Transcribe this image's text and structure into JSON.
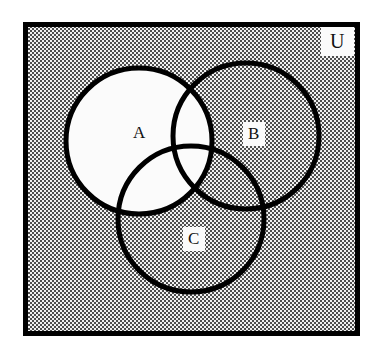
{
  "figure": {
    "kind": "venn-diagram",
    "set_count": 3
  },
  "frame": {
    "name": "universal-set-rectangle",
    "border_color": "#000000",
    "fill_pattern": "gray-stipple",
    "fill_color": "#8c8c8c",
    "x": 23,
    "y": 22,
    "width": 337,
    "height": 314,
    "border_width": 5
  },
  "labels": {
    "universe": "U",
    "set_a": "A",
    "set_b": "B",
    "set_c": "C"
  },
  "circles": [
    {
      "id": "circle-a",
      "label": "A",
      "cx": 139,
      "cy": 141,
      "r": 73,
      "fill": "#fbfbfb",
      "stroke": "#000000",
      "stroke_width": 5
    },
    {
      "id": "circle-b",
      "label": "B",
      "cx": 246,
      "cy": 136,
      "r": 73,
      "fill": "none",
      "stroke": "#000000",
      "stroke_width": 5
    },
    {
      "id": "circle-c",
      "label": "C",
      "cx": 191,
      "cy": 219,
      "r": 73,
      "fill": "none",
      "stroke": "#000000",
      "stroke_width": 5
    }
  ],
  "colors": {
    "ink": "#000000",
    "paper": "#ffffff",
    "label_box": "#fbfbfb",
    "stipple_dark": "#4a4a4a",
    "stipple_light": "#e8e8e8"
  }
}
